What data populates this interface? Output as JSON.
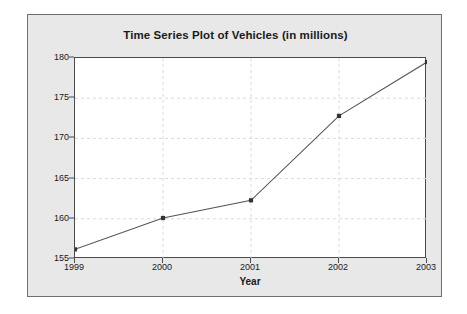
{
  "chart_data": {
    "type": "line",
    "title": "Time Series Plot of Vehicles (in millions)",
    "xlabel": "Year",
    "ylabel": "Vehicles (in millions)",
    "categories": [
      "1999",
      "2000",
      "2001",
      "2002",
      "2003"
    ],
    "x": [
      1999,
      2000,
      2001,
      2002,
      2003
    ],
    "values": [
      156.2,
      160.1,
      162.3,
      172.8,
      179.5
    ],
    "series": [
      {
        "name": "Vehicles",
        "values": [
          156.2,
          160.1,
          162.3,
          172.8,
          179.5
        ]
      }
    ],
    "ylim": [
      155,
      180
    ],
    "xlim": [
      1999,
      2003
    ],
    "yticks": [
      155,
      160,
      165,
      170,
      175,
      180
    ],
    "ytick_labels": [
      "155",
      "160",
      "165",
      "170",
      "175",
      "180"
    ],
    "xticks": [
      1999,
      2000,
      2001,
      2002,
      2003
    ],
    "xtick_labels": [
      "1999",
      "2000",
      "2001",
      "2002",
      "2003"
    ],
    "grid": true,
    "grid_style": "dashed",
    "legend": false,
    "marker": "square",
    "line_color": "#555555",
    "marker_color": "#333333",
    "grid_color": "#d8d8e4",
    "plot_background": "#ffffff",
    "panel_background": "#e8e8e8",
    "axis_color": "#4a4a4a"
  }
}
